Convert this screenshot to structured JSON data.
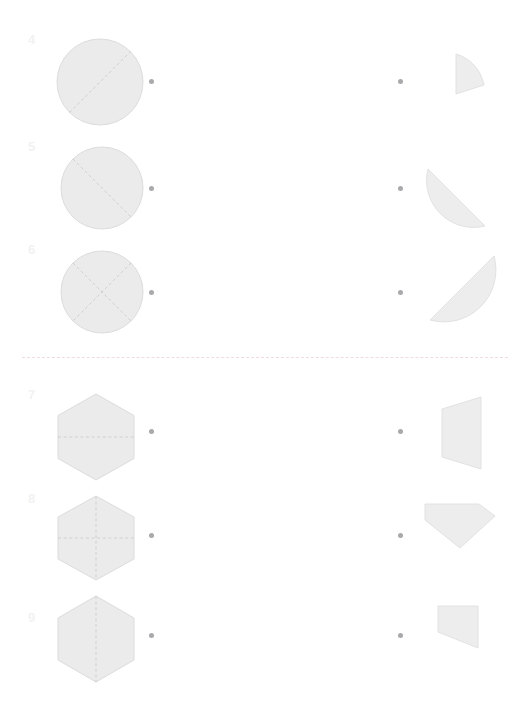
{
  "page": {
    "background_color": "#ffffff",
    "width": 519,
    "height": 713
  },
  "style": {
    "shape_fill": "#ebebeb",
    "shape_stroke": "#dcdcdc",
    "cut_line_color": "#cfcfcf",
    "dot_color": "#a9a9ad",
    "number_color": "#f2f2f3",
    "divider_color": "#f0dcdc"
  },
  "divider": {
    "name": "section-divider",
    "style": "dashed",
    "y": 357
  },
  "sections": [
    {
      "id": "circles",
      "label": "Circle fractions",
      "rows": [
        {
          "number": "4",
          "left": {
            "shape": "circle",
            "parts": 2,
            "cut": "one-diagonal",
            "label": "circle-divided-in-halves-diagonal"
          },
          "right": {
            "shape": "quarter-circle-sector",
            "fraction": "1/4",
            "label": "quarter-circle-piece"
          },
          "left_dot": true,
          "right_dot": true
        },
        {
          "number": "5",
          "left": {
            "shape": "circle",
            "parts": 2,
            "cut": "one-diagonal",
            "label": "circle-divided-in-halves-diagonal"
          },
          "right": {
            "shape": "half-circle",
            "fraction": "1/2",
            "label": "half-circle-piece"
          },
          "left_dot": true,
          "right_dot": true
        },
        {
          "number": "6",
          "left": {
            "shape": "circle",
            "parts": 4,
            "cut": "two-diagonals-x",
            "label": "circle-divided-in-quarters-x"
          },
          "right": {
            "shape": "half-circle-tilted",
            "fraction": "1/2",
            "label": "half-circle-tilted-piece"
          },
          "left_dot": true,
          "right_dot": true
        }
      ]
    },
    {
      "id": "hexagons",
      "label": "Hexagon fractions",
      "rows": [
        {
          "number": "7",
          "left": {
            "shape": "hexagon",
            "parts": 2,
            "cut": "horizontal",
            "label": "hexagon-divided-in-halves-horizontal"
          },
          "right": {
            "shape": "trapezoid-vertical",
            "fraction": "1/2",
            "label": "hexagon-half-trapezoid-piece"
          },
          "left_dot": true,
          "right_dot": true
        },
        {
          "number": "8",
          "left": {
            "shape": "hexagon",
            "parts": 4,
            "cut": "cross",
            "label": "hexagon-divided-in-quarters-cross"
          },
          "right": {
            "shape": "half-hexagon-point-down",
            "fraction": "1/2",
            "label": "hexagon-half-point-down-piece"
          },
          "left_dot": true,
          "right_dot": true
        },
        {
          "number": "9",
          "left": {
            "shape": "hexagon",
            "parts": 2,
            "cut": "vertical",
            "label": "hexagon-divided-in-halves-vertical"
          },
          "right": {
            "shape": "hexagon-quarter-quadrilateral",
            "fraction": "1/4",
            "label": "hexagon-quarter-piece"
          },
          "left_dot": true,
          "right_dot": true
        }
      ]
    }
  ]
}
